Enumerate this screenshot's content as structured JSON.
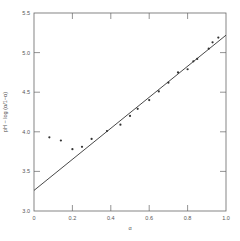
{
  "chart_data": {
    "type": "scatter",
    "title": "",
    "xlabel": "α",
    "ylabel": "pH − log (α/1−α)",
    "xlim": [
      0,
      1.0
    ],
    "ylim": [
      3.0,
      5.5
    ],
    "grid": false,
    "legend": null,
    "x_ticks": [
      "0",
      "0.2",
      "0.4",
      "0.6",
      "0.8",
      "1.0"
    ],
    "y_ticks": [
      "3.0",
      "3.5",
      "4.0",
      "4.5",
      "5.0",
      "5.5"
    ],
    "series": [
      {
        "name": "measured points",
        "type": "scatter",
        "x": [
          0.08,
          0.14,
          0.2,
          0.25,
          0.3,
          0.38,
          0.45,
          0.5,
          0.54,
          0.6,
          0.65,
          0.7,
          0.75,
          0.8,
          0.83,
          0.85,
          0.91,
          0.93,
          0.96
        ],
        "y": [
          3.93,
          3.89,
          3.78,
          3.81,
          3.91,
          4.01,
          4.09,
          4.2,
          4.29,
          4.4,
          4.51,
          4.62,
          4.75,
          4.79,
          4.89,
          4.92,
          5.05,
          5.13,
          5.19
        ]
      },
      {
        "name": "fitted line",
        "type": "line",
        "x": [
          0,
          1.0
        ],
        "y": [
          3.26,
          5.22
        ]
      }
    ]
  }
}
